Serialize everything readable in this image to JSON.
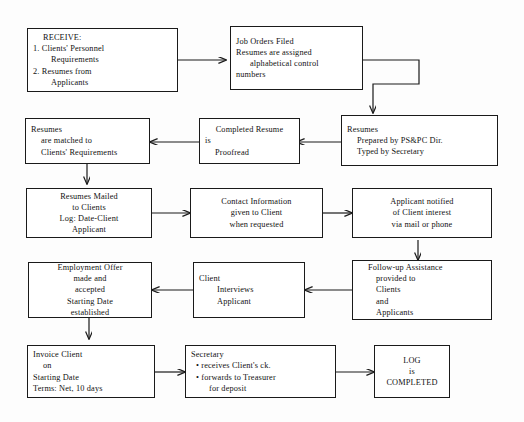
{
  "diagram": {
    "background_color": "#fdfdfd",
    "line_color": "#1a1a1a",
    "text_color": "#111111",
    "nodes": [
      {
        "id": "receive",
        "name": "receive-box",
        "lines": [
          "RECEIVE:",
          "1. Clients' Personnel",
          "Requirements",
          "2. Resumes from",
          "Applicants"
        ]
      },
      {
        "id": "job-orders",
        "name": "job-orders-filed-box",
        "lines": [
          "Job Orders Filed",
          "Resumes are assigned",
          "alphabetical control",
          "numbers"
        ]
      },
      {
        "id": "resumes-prepared",
        "name": "resumes-prepared-box",
        "lines": [
          "Resumes",
          "Prepared by PS&PC Dir.",
          "Typed by Secretary"
        ]
      },
      {
        "id": "completed-resume",
        "name": "completed-resume-proofread-box",
        "lines": [
          "Completed Resume",
          "is",
          "Proofread"
        ]
      },
      {
        "id": "resumes-matched",
        "name": "resumes-matched-box",
        "lines": [
          "Resumes",
          "are matched to",
          "Clients' Requirements"
        ]
      },
      {
        "id": "resumes-mailed",
        "name": "resumes-mailed-box",
        "lines": [
          "Resumes Mailed",
          "to Clients",
          "Log: Date-Client",
          "Applicant"
        ]
      },
      {
        "id": "contact-info",
        "name": "contact-information-box",
        "lines": [
          "Contact Information",
          "given to Client",
          "when requested"
        ]
      },
      {
        "id": "applicant-notified",
        "name": "applicant-notified-box",
        "lines": [
          "Applicant notified",
          "of Client interest",
          "via mail or phone"
        ]
      },
      {
        "id": "follow-up",
        "name": "follow-up-assistance-box",
        "lines": [
          "Follow-up Assistance",
          "provided to",
          "Clients",
          "and",
          "Applicants"
        ]
      },
      {
        "id": "client-interviews",
        "name": "client-interviews-applicant-box",
        "lines": [
          "Client",
          "Interviews",
          "Applicant"
        ]
      },
      {
        "id": "employment-offer",
        "name": "employment-offer-box",
        "lines": [
          "Employment Offer",
          "made and",
          "accepted",
          "Starting Date",
          "established"
        ]
      },
      {
        "id": "invoice-client",
        "name": "invoice-client-box",
        "lines": [
          "Invoice Client",
          "on",
          "Starting Date",
          "Terms: Net, 10 days"
        ]
      },
      {
        "id": "secretary",
        "name": "secretary-box",
        "lines": [
          "Secretary",
          "• receives Client's ck.",
          "• forwards to Treasurer",
          "for deposit"
        ]
      },
      {
        "id": "log-completed",
        "name": "log-completed-box",
        "lines": [
          "LOG",
          "is",
          "COMPLETED"
        ]
      }
    ],
    "connectors": [
      {
        "from": "receive",
        "to": "job-orders",
        "direction": "right"
      },
      {
        "from": "job-orders",
        "to": "resumes-prepared",
        "direction": "right-down"
      },
      {
        "from": "resumes-prepared",
        "to": "completed-resume",
        "direction": "left"
      },
      {
        "from": "completed-resume",
        "to": "resumes-matched",
        "direction": "left"
      },
      {
        "from": "resumes-matched",
        "to": "resumes-mailed",
        "direction": "down"
      },
      {
        "from": "resumes-mailed",
        "to": "contact-info",
        "direction": "right"
      },
      {
        "from": "contact-info",
        "to": "applicant-notified",
        "direction": "right"
      },
      {
        "from": "applicant-notified",
        "to": "follow-up",
        "direction": "down"
      },
      {
        "from": "follow-up",
        "to": "client-interviews",
        "direction": "left"
      },
      {
        "from": "client-interviews",
        "to": "employment-offer",
        "direction": "left"
      },
      {
        "from": "employment-offer",
        "to": "invoice-client",
        "direction": "down"
      },
      {
        "from": "invoice-client",
        "to": "secretary",
        "direction": "right"
      },
      {
        "from": "secretary",
        "to": "log-completed",
        "direction": "right"
      }
    ]
  }
}
